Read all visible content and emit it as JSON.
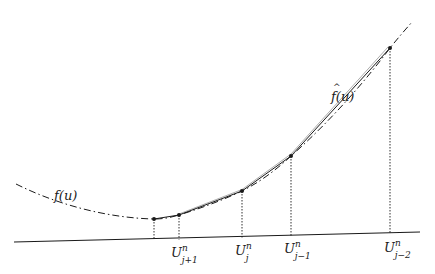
{
  "diagram": {
    "type": "function-approximation",
    "curves": [
      {
        "name": "f(u)",
        "style": "dash-dot",
        "label": "f(u)"
      },
      {
        "name": "f-hat(u)",
        "style": "solid",
        "label": "f̂(u)"
      }
    ],
    "labels": {
      "f": "f(u)",
      "f_hat_base": "f",
      "f_hat_arg": "(u)"
    },
    "points": [
      {
        "id": "p0",
        "x": 154,
        "y": 219,
        "label": null
      },
      {
        "id": "p1",
        "x": 179,
        "y": 215,
        "label_base": "U",
        "sup": "n",
        "sub": "j+1"
      },
      {
        "id": "p2",
        "x": 242,
        "y": 191,
        "label_base": "U",
        "sup": "n",
        "sub": "j"
      },
      {
        "id": "p3",
        "x": 291,
        "y": 156,
        "label_base": "U",
        "sup": "n",
        "sub": "j−1"
      },
      {
        "id": "p4",
        "x": 390,
        "y": 48,
        "label_base": "U",
        "sup": "n",
        "sub": "j−2"
      }
    ],
    "axis": {
      "x1": 14,
      "y1": 242,
      "x2": 420,
      "y2": 232
    },
    "colors": {
      "stroke": "#1a1a1a",
      "background": "#ffffff"
    }
  }
}
